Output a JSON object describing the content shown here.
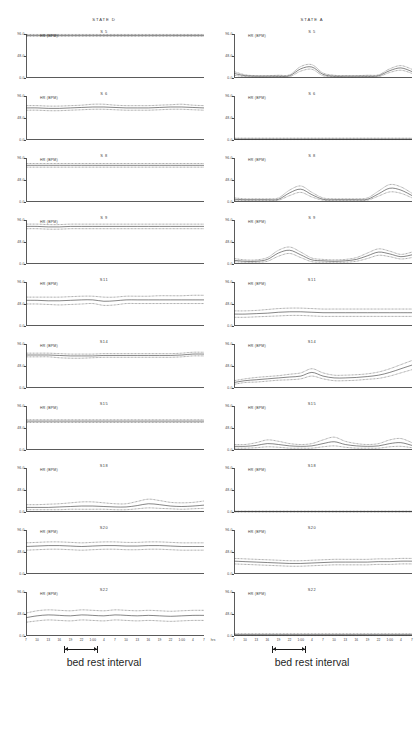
{
  "figure": {
    "width": 416,
    "height": 731,
    "background": "#ffffff",
    "line_color": "#3a3a3a"
  },
  "columns": [
    {
      "header": "STATE  D",
      "caption": "bed rest interval"
    },
    {
      "header": "STATE  A",
      "caption": "bed rest interval"
    }
  ],
  "axes": {
    "y_label": "HR (BPM)",
    "y_ticks": [
      "96.0",
      "48.0",
      "0.0"
    ],
    "y_min": 0,
    "y_max": 96,
    "x_tick_labels": [
      "7",
      "10",
      "13",
      "16",
      "19",
      "22",
      "1:00",
      "4",
      "7",
      "10",
      "13",
      "16",
      "19",
      "22",
      "1:00",
      "4",
      "7"
    ],
    "x_unit": "hrs",
    "x_minor_ticks_per_major": 3
  },
  "interval": {
    "label": "bed rest interval",
    "start_fraction": 0.215,
    "end_fraction": 0.405
  },
  "chart_data": {
    "type": "line",
    "xlabel": "hrs",
    "ylabel": "HR (BPM)",
    "ylim": [
      0,
      96
    ],
    "yticks": [
      0,
      48,
      96
    ],
    "x": [
      "7",
      "10",
      "13",
      "16",
      "19",
      "22",
      "1:00",
      "4",
      "7",
      "10",
      "13",
      "16",
      "19",
      "22",
      "1:00",
      "4",
      "7"
    ],
    "grid": false,
    "legend": "none",
    "series_per_panel": [
      "upper bound",
      "mean",
      "lower bound"
    ],
    "panels": [
      {
        "column": "STATE  D",
        "subject": "S 5",
        "mean": [
          93,
          93,
          93,
          93,
          93,
          93,
          93,
          93,
          93,
          93,
          93,
          93,
          93,
          93,
          93,
          93,
          93
        ],
        "upper": [
          95,
          95,
          95,
          95,
          95,
          95,
          95,
          95,
          95,
          95,
          95,
          95,
          95,
          95,
          95,
          95,
          95
        ],
        "lower": [
          91,
          91,
          91,
          91,
          91,
          91,
          91,
          91,
          91,
          91,
          91,
          91,
          91,
          91,
          91,
          91,
          91
        ]
      },
      {
        "column": "STATE  D",
        "subject": "S 6",
        "mean": [
          70,
          70,
          69,
          69,
          70,
          71,
          72,
          72,
          71,
          70,
          70,
          70,
          71,
          72,
          72,
          71,
          70
        ],
        "upper": [
          75,
          75,
          74,
          74,
          75,
          76,
          78,
          78,
          76,
          75,
          75,
          75,
          76,
          77,
          78,
          76,
          75
        ],
        "lower": [
          65,
          65,
          64,
          64,
          65,
          66,
          67,
          67,
          66,
          65,
          65,
          65,
          66,
          67,
          67,
          66,
          65
        ]
      },
      {
        "column": "STATE  D",
        "subject": "S 8",
        "mean": [
          80,
          80,
          80,
          80,
          80,
          80,
          80,
          80,
          80,
          80,
          80,
          80,
          80,
          80,
          80,
          80,
          80
        ],
        "upper": [
          84,
          84,
          84,
          84,
          84,
          84,
          84,
          84,
          84,
          84,
          84,
          84,
          84,
          84,
          84,
          84,
          84
        ],
        "lower": [
          76,
          76,
          76,
          76,
          76,
          76,
          76,
          76,
          76,
          76,
          76,
          76,
          76,
          76,
          76,
          76,
          76
        ]
      },
      {
        "column": "STATE  D",
        "subject": "S 9",
        "mean": [
          82,
          82,
          81,
          81,
          82,
          82,
          82,
          82,
          82,
          82,
          82,
          82,
          82,
          82,
          82,
          82,
          82
        ],
        "upper": [
          87,
          87,
          86,
          86,
          87,
          87,
          87,
          87,
          87,
          87,
          87,
          87,
          87,
          87,
          87,
          87,
          87
        ],
        "lower": [
          77,
          77,
          76,
          76,
          77,
          77,
          77,
          77,
          77,
          77,
          77,
          77,
          77,
          77,
          77,
          77,
          77
        ]
      },
      {
        "column": "STATE  D",
        "subject": "S11",
        "mean": [
          56,
          56,
          55,
          55,
          56,
          57,
          57,
          54,
          55,
          57,
          57,
          57,
          57,
          57,
          57,
          57,
          57
        ],
        "upper": [
          63,
          63,
          63,
          63,
          64,
          65,
          65,
          63,
          63,
          65,
          65,
          65,
          66,
          66,
          66,
          67,
          67
        ],
        "lower": [
          48,
          48,
          47,
          46,
          47,
          48,
          49,
          45,
          46,
          49,
          49,
          49,
          49,
          49,
          49,
          49,
          49
        ]
      },
      {
        "column": "STATE  D",
        "subject": "S14",
        "mean": [
          72,
          72,
          72,
          71,
          70,
          70,
          70,
          71,
          71,
          71,
          71,
          71,
          71,
          71,
          72,
          74,
          74
        ],
        "upper": [
          76,
          76,
          76,
          75,
          74,
          74,
          74,
          75,
          75,
          75,
          75,
          75,
          75,
          75,
          76,
          78,
          78
        ],
        "lower": [
          68,
          68,
          68,
          66,
          65,
          65,
          66,
          67,
          67,
          67,
          67,
          67,
          67,
          67,
          68,
          70,
          70
        ]
      },
      {
        "column": "STATE  D",
        "subject": "S15",
        "mean": [
          63,
          63,
          63,
          63,
          63,
          63,
          63,
          63,
          63,
          63,
          63,
          63,
          63,
          63,
          63,
          63,
          63
        ],
        "upper": [
          66,
          66,
          66,
          66,
          66,
          66,
          66,
          66,
          66,
          66,
          66,
          66,
          66,
          66,
          66,
          66,
          66
        ],
        "lower": [
          60,
          60,
          60,
          60,
          60,
          60,
          60,
          60,
          60,
          60,
          60,
          60,
          60,
          60,
          60,
          60,
          60
        ]
      },
      {
        "column": "STATE  D",
        "subject": "S18",
        "mean": [
          10,
          10,
          10,
          11,
          12,
          13,
          13,
          12,
          11,
          11,
          14,
          18,
          16,
          13,
          12,
          13,
          15
        ],
        "upper": [
          16,
          16,
          17,
          18,
          20,
          22,
          22,
          20,
          18,
          18,
          23,
          28,
          25,
          21,
          20,
          21,
          24
        ],
        "lower": [
          5,
          5,
          5,
          5,
          6,
          6,
          6,
          6,
          5,
          5,
          7,
          9,
          8,
          7,
          6,
          7,
          8
        ]
      },
      {
        "column": "STATE  D",
        "subject": "S20",
        "mean": [
          60,
          61,
          62,
          62,
          61,
          60,
          61,
          62,
          62,
          61,
          61,
          62,
          62,
          61,
          60,
          60,
          60
        ],
        "upper": [
          68,
          69,
          70,
          70,
          69,
          68,
          69,
          70,
          70,
          69,
          69,
          70,
          70,
          69,
          68,
          68,
          68
        ],
        "lower": [
          52,
          53,
          54,
          54,
          53,
          52,
          53,
          54,
          54,
          53,
          53,
          54,
          54,
          53,
          52,
          52,
          52
        ]
      },
      {
        "column": "STATE  D",
        "subject": "S22",
        "mean": [
          40,
          44,
          46,
          45,
          44,
          46,
          45,
          44,
          46,
          45,
          44,
          45,
          44,
          43,
          44,
          45,
          45
        ],
        "upper": [
          50,
          55,
          57,
          56,
          55,
          57,
          56,
          55,
          57,
          56,
          55,
          56,
          55,
          54,
          55,
          56,
          56
        ],
        "lower": [
          30,
          33,
          35,
          34,
          33,
          35,
          34,
          33,
          35,
          34,
          33,
          34,
          33,
          32,
          33,
          34,
          34
        ]
      },
      {
        "column": "STATE  A",
        "subject": "S 5",
        "mean": [
          10,
          5,
          4,
          4,
          4,
          5,
          20,
          24,
          8,
          4,
          4,
          4,
          4,
          5,
          16,
          22,
          14
        ],
        "upper": [
          14,
          7,
          5,
          5,
          6,
          7,
          25,
          29,
          11,
          6,
          5,
          5,
          6,
          7,
          20,
          27,
          19
        ],
        "lower": [
          6,
          3,
          2,
          2,
          3,
          3,
          15,
          19,
          5,
          3,
          2,
          2,
          3,
          3,
          12,
          17,
          10
        ]
      },
      {
        "column": "STATE  A",
        "subject": "S 6",
        "mean": [
          2,
          2,
          2,
          2,
          2,
          2,
          2,
          2,
          2,
          2,
          2,
          2,
          2,
          2,
          2,
          2,
          2
        ],
        "upper": [
          4,
          4,
          4,
          4,
          4,
          4,
          4,
          4,
          4,
          4,
          4,
          4,
          4,
          4,
          4,
          4,
          4
        ],
        "lower": [
          1,
          1,
          1,
          1,
          1,
          1,
          1,
          1,
          1,
          1,
          1,
          1,
          1,
          1,
          1,
          1,
          1
        ]
      },
      {
        "column": "STATE  A",
        "subject": "S 8",
        "mean": [
          6,
          5,
          5,
          5,
          6,
          20,
          28,
          16,
          6,
          5,
          5,
          5,
          6,
          18,
          30,
          26,
          14
        ],
        "upper": [
          9,
          7,
          7,
          7,
          9,
          26,
          35,
          21,
          9,
          7,
          7,
          7,
          9,
          24,
          38,
          33,
          19
        ],
        "lower": [
          3,
          3,
          3,
          3,
          4,
          14,
          21,
          11,
          4,
          3,
          3,
          3,
          4,
          13,
          22,
          19,
          9
        ]
      },
      {
        "column": "STATE  A",
        "subject": "S 9",
        "mean": [
          8,
          6,
          6,
          10,
          24,
          30,
          20,
          9,
          7,
          6,
          7,
          10,
          18,
          26,
          22,
          16,
          20
        ],
        "upper": [
          12,
          9,
          9,
          14,
          30,
          37,
          26,
          13,
          10,
          9,
          10,
          14,
          24,
          33,
          28,
          21,
          26
        ],
        "lower": [
          5,
          4,
          4,
          6,
          17,
          23,
          14,
          5,
          4,
          4,
          4,
          6,
          12,
          19,
          16,
          11,
          14
        ]
      },
      {
        "column": "STATE  A",
        "subject": "S11",
        "mean": [
          26,
          26,
          27,
          28,
          30,
          31,
          31,
          30,
          29,
          29,
          29,
          29,
          29,
          29,
          29,
          29,
          29
        ],
        "upper": [
          33,
          33,
          34,
          36,
          38,
          39,
          39,
          38,
          37,
          37,
          37,
          37,
          37,
          37,
          37,
          37,
          37
        ],
        "lower": [
          19,
          19,
          20,
          21,
          22,
          23,
          23,
          22,
          21,
          21,
          21,
          21,
          21,
          21,
          21,
          21,
          21
        ]
      },
      {
        "column": "STATE  A",
        "subject": "S14",
        "mean": [
          12,
          16,
          18,
          20,
          22,
          24,
          26,
          34,
          26,
          22,
          22,
          23,
          25,
          28,
          34,
          42,
          50
        ],
        "upper": [
          16,
          20,
          23,
          25,
          27,
          30,
          33,
          42,
          33,
          28,
          28,
          29,
          31,
          35,
          42,
          51,
          60
        ],
        "lower": [
          8,
          12,
          13,
          15,
          17,
          18,
          20,
          26,
          20,
          16,
          16,
          17,
          19,
          21,
          26,
          33,
          40
        ]
      },
      {
        "column": "STATE  A",
        "subject": "S15",
        "mean": [
          8,
          8,
          10,
          14,
          12,
          9,
          8,
          9,
          14,
          18,
          12,
          9,
          8,
          9,
          14,
          16,
          10
        ],
        "upper": [
          12,
          12,
          16,
          22,
          19,
          14,
          12,
          14,
          22,
          28,
          19,
          14,
          12,
          14,
          22,
          25,
          16
        ],
        "lower": [
          4,
          4,
          5,
          7,
          6,
          4,
          4,
          4,
          7,
          9,
          6,
          4,
          4,
          4,
          7,
          8,
          5
        ]
      },
      {
        "column": "STATE  A",
        "subject": "S18",
        "mean": [
          1,
          1,
          1,
          1,
          1,
          1,
          1,
          1,
          1,
          1,
          1,
          1,
          1,
          1,
          1,
          1,
          1
        ],
        "upper": [
          2,
          2,
          2,
          2,
          2,
          2,
          2,
          2,
          2,
          2,
          2,
          2,
          2,
          2,
          2,
          2,
          2
        ],
        "lower": [
          0,
          0,
          0,
          0,
          0,
          0,
          0,
          0,
          0,
          0,
          0,
          0,
          0,
          0,
          0,
          0,
          0
        ]
      },
      {
        "column": "STATE  A",
        "subject": "S20",
        "mean": [
          28,
          27,
          26,
          25,
          24,
          23,
          23,
          24,
          25,
          26,
          26,
          26,
          26,
          27,
          27,
          28,
          28
        ],
        "upper": [
          34,
          33,
          32,
          31,
          30,
          29,
          29,
          30,
          31,
          32,
          32,
          32,
          32,
          33,
          33,
          34,
          34
        ],
        "lower": [
          22,
          21,
          20,
          19,
          18,
          17,
          17,
          18,
          19,
          20,
          20,
          20,
          20,
          21,
          21,
          22,
          22
        ]
      },
      {
        "column": "STATE  A",
        "subject": "S22",
        "mean": [
          3,
          3,
          3,
          3,
          3,
          3,
          3,
          3,
          3,
          3,
          3,
          3,
          3,
          3,
          3,
          3,
          3
        ],
        "upper": [
          5,
          5,
          5,
          5,
          5,
          5,
          5,
          5,
          5,
          5,
          5,
          5,
          5,
          5,
          5,
          5,
          5
        ],
        "lower": [
          1,
          1,
          1,
          1,
          1,
          1,
          1,
          1,
          1,
          1,
          1,
          1,
          1,
          1,
          1,
          1,
          1
        ]
      }
    ]
  }
}
